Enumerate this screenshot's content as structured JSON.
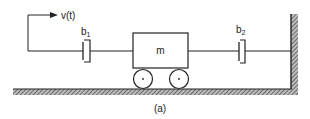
{
  "diagram": {
    "input_label": "v(t)",
    "damper1": {
      "label": "b",
      "subscript": "1"
    },
    "damper2": {
      "label": "b",
      "subscript": "2"
    },
    "mass": {
      "label": "m"
    },
    "caption": "(a)"
  },
  "colors": {
    "line": "#222222",
    "hatch": "#555555",
    "background": "#ffffff"
  }
}
